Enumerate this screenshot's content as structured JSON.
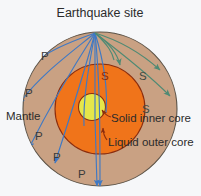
{
  "diagram": {
    "title": "Earthquake site",
    "background_color": "#f6f7f9",
    "layers": {
      "mantle": {
        "label": "Mantle",
        "color": "#c9a183",
        "outline": "#5c5347"
      },
      "outer_core": {
        "label": "Liquid outer core",
        "color": "#f0741a",
        "outline": "#8c2d0d"
      },
      "inner_core": {
        "label": "Solid inner core",
        "color": "#e6e64a",
        "outline": "#8c2d0d"
      }
    },
    "waves": {
      "p": {
        "label": "P",
        "color": "#3f79c4",
        "count": 6
      },
      "s": {
        "label": "S",
        "color": "#4f8a74",
        "count": 3
      }
    },
    "p_labels": [
      "P",
      "P",
      "P",
      "P",
      "P"
    ],
    "s_labels": [
      "S",
      "S",
      "S"
    ],
    "source_point": {
      "x": 95,
      "y": 33
    }
  }
}
